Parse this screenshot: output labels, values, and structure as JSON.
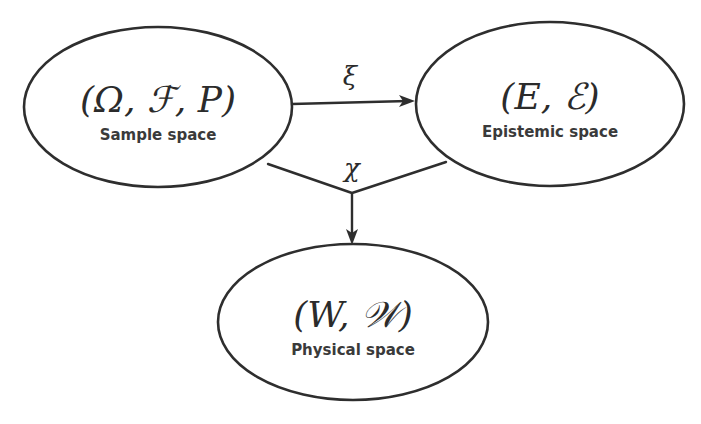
{
  "diagram": {
    "background_color": "#ffffff",
    "stroke_color": "#2e2e2e",
    "text_color": "#2b2b2b",
    "caption_color": "#3a3a3a",
    "nodes": [
      {
        "id": "sample-space",
        "math": "(Ω, ℱ, P)",
        "caption": "Sample space",
        "cx": 158,
        "cy": 107,
        "rx": 134,
        "ry": 80,
        "math_font_size": 36,
        "caption_font_size": 15,
        "math_y": 112,
        "caption_y": 140
      },
      {
        "id": "epistemic-space",
        "math": "(E, ℰ)",
        "caption": "Epistemic space",
        "cx": 550,
        "cy": 104,
        "rx": 134,
        "ry": 82,
        "math_font_size": 36,
        "caption_font_size": 15,
        "math_y": 109,
        "caption_y": 137
      },
      {
        "id": "physical-space",
        "math": "(W, 𝒲)",
        "caption": "Physical space",
        "cx": 353,
        "cy": 322,
        "rx": 135,
        "ry": 78,
        "math_font_size": 36,
        "caption_font_size": 15,
        "math_y": 327,
        "caption_y": 355
      }
    ],
    "edges": [
      {
        "id": "xi-edge",
        "label": "ξ",
        "from": "sample-space",
        "to": "epistemic-space",
        "label_x": 350,
        "label_y": 85,
        "label_font_size": 26,
        "path": "M 292 104 L 408 101",
        "arrow_tip_x": 415,
        "arrow_tip_y": 101,
        "arrow_angle": -1.5
      },
      {
        "id": "chi-edge",
        "label": "χ",
        "from": "sample-space",
        "to": "physical-space",
        "label_x": 352,
        "label_y": 177,
        "label_font_size": 26,
        "path": "M 268 164 L 352 193 M 446 162 L 352 193 M 352 193 L 352 238",
        "arrow_tip_x": 352,
        "arrow_tip_y": 245,
        "arrow_angle": 90
      }
    ]
  }
}
